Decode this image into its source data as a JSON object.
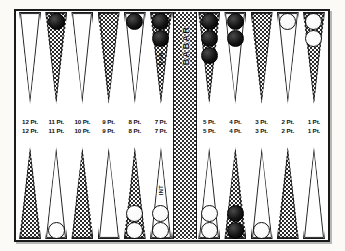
{
  "board": {
    "title": "Backgammon Board Diagram",
    "bar_label_top": "BAR",
    "bar_label_bottom": "BAR",
    "point_label_suffix": "Pt.",
    "colors": {
      "frame": "#1a1a1a",
      "checker_black": "#141414",
      "checker_white": "#ffffff",
      "triangle_dotted": "#2a2a2a",
      "page_background": "#fbfaf7"
    },
    "annotations": {
      "top_7pt": "BAR",
      "bottom_7pt": "INT"
    }
  },
  "top_row": [
    {
      "label": "12 Pt.",
      "fill": "plain",
      "checkers": 0,
      "color": "none"
    },
    {
      "label": "11 Pt.",
      "fill": "dotted",
      "checkers": 1,
      "color": "black"
    },
    {
      "label": "10 Pt.",
      "fill": "plain",
      "checkers": 0,
      "color": "none"
    },
    {
      "label": "9 Pt.",
      "fill": "dotted",
      "checkers": 0,
      "color": "none"
    },
    {
      "label": "8 Pt.",
      "fill": "plain",
      "checkers": 1,
      "color": "black"
    },
    {
      "label": "7 Pt.",
      "fill": "dotted",
      "checkers": 2,
      "color": "black",
      "note": "BAR"
    },
    {
      "label": "6 Pt.",
      "fill": "plain",
      "checkers": 4,
      "color": "black"
    },
    {
      "label": "5 Pt.",
      "fill": "dotted",
      "checkers": 3,
      "color": "black"
    },
    {
      "label": "4 Pt.",
      "fill": "plain",
      "checkers": 2,
      "color": "black"
    },
    {
      "label": "3 Pt.",
      "fill": "dotted",
      "checkers": 0,
      "color": "none"
    },
    {
      "label": "2 Pt.",
      "fill": "plain",
      "checkers": 1,
      "color": "white"
    },
    {
      "label": "1 Pt.",
      "fill": "dotted",
      "checkers": 2,
      "color": "white"
    }
  ],
  "bottom_row": [
    {
      "label": "12 Pt.",
      "fill": "dotted",
      "checkers": 0,
      "color": "none"
    },
    {
      "label": "11 Pt.",
      "fill": "plain",
      "checkers": 1,
      "color": "white"
    },
    {
      "label": "10 Pt.",
      "fill": "dotted",
      "checkers": 0,
      "color": "none"
    },
    {
      "label": "9 Pt.",
      "fill": "plain",
      "checkers": 0,
      "color": "none"
    },
    {
      "label": "8 Pt.",
      "fill": "dotted",
      "checkers": 2,
      "color": "white"
    },
    {
      "label": "7 Pt.",
      "fill": "plain",
      "checkers": 2,
      "color": "white",
      "note": "INT"
    },
    {
      "label": "6 Pt.",
      "fill": "plain",
      "checkers": 4,
      "color": "white"
    },
    {
      "label": "5 Pt.",
      "fill": "plain",
      "checkers": 2,
      "color": "white"
    },
    {
      "label": "4 Pt.",
      "fill": "dotted",
      "checkers": 2,
      "color": "black"
    },
    {
      "label": "3 Pt.",
      "fill": "plain",
      "checkers": 1,
      "color": "white"
    },
    {
      "label": "2 Pt.",
      "fill": "dotted",
      "checkers": 0,
      "color": "none"
    },
    {
      "label": "1 Pt.",
      "fill": "plain",
      "checkers": 0,
      "color": "none"
    }
  ]
}
